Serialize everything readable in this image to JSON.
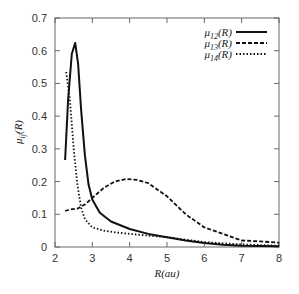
{
  "chart_data": {
    "type": "line",
    "title": "",
    "xlabel": "R(au)",
    "ylabel": "μij(R)",
    "xlim": [
      2,
      8
    ],
    "ylim": [
      0,
      0.7
    ],
    "xticks": [
      2,
      3,
      4,
      5,
      6,
      7,
      8
    ],
    "yticks": [
      0,
      0.1,
      0.2,
      0.3,
      0.4,
      0.5,
      0.6,
      0.7
    ],
    "grid": false,
    "legend_position": "upper right",
    "series": [
      {
        "name": "μ12(R)",
        "style": "solid",
        "x": [
          2.27,
          2.35,
          2.45,
          2.54,
          2.62,
          2.7,
          2.8,
          2.9,
          3.0,
          3.2,
          3.5,
          4.0,
          4.5,
          5.0,
          5.5,
          6.0,
          6.5,
          7.0,
          7.5,
          8.0
        ],
        "y": [
          0.266,
          0.45,
          0.59,
          0.624,
          0.56,
          0.42,
          0.28,
          0.19,
          0.145,
          0.105,
          0.078,
          0.055,
          0.04,
          0.03,
          0.02,
          0.012,
          0.007,
          0.004,
          0.003,
          0.002
        ]
      },
      {
        "name": "μ13(R)",
        "style": "dashed",
        "x": [
          2.27,
          2.4,
          2.6,
          2.8,
          3.0,
          3.3,
          3.6,
          3.9,
          4.2,
          4.5,
          5.0,
          5.5,
          6.0,
          6.5,
          7.0,
          7.5,
          8.0
        ],
        "y": [
          0.11,
          0.115,
          0.117,
          0.13,
          0.15,
          0.18,
          0.2,
          0.208,
          0.205,
          0.195,
          0.155,
          0.1,
          0.06,
          0.04,
          0.02,
          0.017,
          0.013
        ]
      },
      {
        "name": "μ14(R)",
        "style": "dotted",
        "x": [
          2.3,
          2.4,
          2.5,
          2.6,
          2.7,
          2.8,
          3.0,
          3.3,
          3.6,
          4.0,
          4.5,
          5.0,
          6.0,
          7.0,
          8.0
        ],
        "y": [
          0.535,
          0.45,
          0.3,
          0.19,
          0.12,
          0.085,
          0.06,
          0.05,
          0.045,
          0.04,
          0.035,
          0.03,
          0.015,
          0.008,
          0.004
        ]
      }
    ]
  },
  "legend": [
    {
      "sub": "12",
      "label_pre": "μ",
      "label_post": "(R)"
    },
    {
      "sub": "13",
      "label_pre": "μ",
      "label_post": "(R)"
    },
    {
      "sub": "14",
      "label_pre": "μ",
      "label_post": "(R)"
    }
  ],
  "axes": {
    "xlabel": "R(au)",
    "ylabel_pre": "μ",
    "ylabel_sub": "ij",
    "ylabel_post": "(R)"
  }
}
